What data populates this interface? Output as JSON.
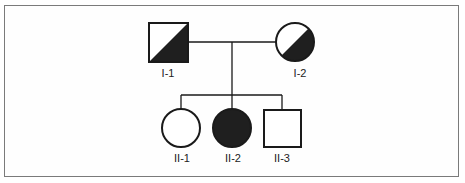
{
  "diagram": {
    "type": "pedigree",
    "colors": {
      "line": "#1a1a1a",
      "fill_affected": "#1f1f1f",
      "fill_unaffected": "#ffffff",
      "frame": "#7a7a7a"
    },
    "generation_1": {
      "individuals": [
        {
          "id": "I-1",
          "label": "I-1",
          "sex": "male",
          "shape": "square",
          "status": "carrier-half-shaded"
        },
        {
          "id": "I-2",
          "label": "I-2",
          "sex": "female",
          "shape": "circle",
          "status": "carrier-half-shaded"
        }
      ]
    },
    "generation_2": {
      "individuals": [
        {
          "id": "II-1",
          "label": "II-1",
          "sex": "female",
          "shape": "circle",
          "status": "unaffected"
        },
        {
          "id": "II-2",
          "label": "II-2",
          "sex": "female",
          "shape": "circle",
          "status": "affected"
        },
        {
          "id": "II-3",
          "label": "II-3",
          "sex": "male",
          "shape": "square",
          "status": "unaffected"
        }
      ]
    }
  }
}
